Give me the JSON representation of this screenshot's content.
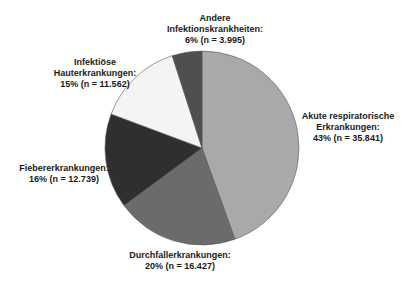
{
  "chart_data": {
    "type": "pie",
    "title": "",
    "start_angle_deg": 0,
    "direction": "clockwise",
    "categories": [
      "Akute respiratorische Erkrankungen",
      "Durchfallerkrankungen",
      "Fiebererkrankungen",
      "Infektiöse Hauterkrankungen",
      "Andere Infektionskrankheiten"
    ],
    "values": [
      35841,
      16427,
      12739,
      11562,
      3995
    ],
    "percentages": [
      43,
      20,
      16,
      15,
      6
    ],
    "colors": [
      "#a9a9a9",
      "#6b6b6b",
      "#2f2f2f",
      "#f4f4f4",
      "#4f4f4f"
    ],
    "legend": "none",
    "labels": [
      {
        "lines": [
          "Akute respiratorische",
          "Erkrankungen:",
          "43% (n = 35.841)"
        ]
      },
      {
        "lines": [
          "Durchfallerkrankungen:",
          "20% (n = 16.427)"
        ]
      },
      {
        "lines": [
          "Fiebererkrankungen:",
          "16% (n = 12.739)"
        ]
      },
      {
        "lines": [
          "Infektiöse",
          "Hauterkrankungen:",
          "15% (n = 11.562)"
        ]
      },
      {
        "lines": [
          "Andere",
          "Infektionskrankheiten:",
          "6% (n = 3.995)"
        ]
      }
    ]
  }
}
